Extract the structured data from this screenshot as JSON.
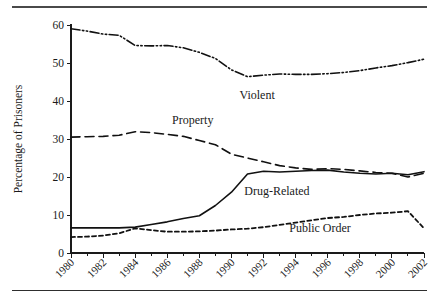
{
  "figure": {
    "top_rule": "horizontal-rule",
    "bottom_rule": "horizontal-rule"
  },
  "chart_data": {
    "type": "line",
    "title": "",
    "xlabel": "",
    "ylabel": "Percentage of Prisoners",
    "xlim": [
      1980,
      2002
    ],
    "ylim": [
      0,
      60
    ],
    "yticks": [
      0,
      10,
      20,
      30,
      40,
      50,
      60
    ],
    "xticks": [
      1980,
      1982,
      1984,
      1986,
      1988,
      1990,
      1992,
      1994,
      1996,
      1998,
      2000,
      2002
    ],
    "minor_xticks": [
      1981,
      1983,
      1985,
      1987,
      1989,
      1991,
      1993,
      1995,
      1997,
      1999,
      2001
    ],
    "grid": false,
    "legend": "inline-labels",
    "x": [
      1980,
      1981,
      1982,
      1983,
      1984,
      1985,
      1986,
      1987,
      1988,
      1989,
      1990,
      1991,
      1992,
      1993,
      1994,
      1995,
      1996,
      1997,
      1998,
      1999,
      2000,
      2001,
      2002
    ],
    "series": [
      {
        "name": "Violent",
        "label": "Violent",
        "style": "dash-dot-dot",
        "values": [
          59.0,
          58.4,
          57.6,
          57.3,
          54.6,
          54.5,
          54.6,
          54.0,
          52.8,
          51.2,
          48.2,
          46.4,
          46.8,
          47.1,
          47.0,
          47.0,
          47.2,
          47.5,
          48.0,
          48.7,
          49.3,
          50.1,
          51.0
        ]
      },
      {
        "name": "Property",
        "label": "Property",
        "style": "dashed",
        "values": [
          30.5,
          30.6,
          30.7,
          31.0,
          31.9,
          31.7,
          31.2,
          30.7,
          29.6,
          28.5,
          26.0,
          25.0,
          24.0,
          23.0,
          22.4,
          22.0,
          22.2,
          22.0,
          21.6,
          21.2,
          21.0,
          20.0,
          21.0
        ]
      },
      {
        "name": "Drug-Related",
        "label": "Drug-Related",
        "style": "solid",
        "values": [
          6.6,
          6.6,
          6.6,
          6.6,
          6.8,
          7.5,
          8.2,
          9.1,
          9.8,
          12.5,
          16.0,
          20.8,
          21.5,
          21.3,
          21.5,
          21.7,
          21.8,
          21.3,
          21.0,
          20.8,
          21.0,
          20.6,
          21.4
        ]
      },
      {
        "name": "Public Order",
        "label": "Public Order",
        "style": "short-dashed",
        "values": [
          4.2,
          4.3,
          4.6,
          5.2,
          6.5,
          6.0,
          5.6,
          5.6,
          5.7,
          5.9,
          6.2,
          6.4,
          6.8,
          7.4,
          8.0,
          8.6,
          9.2,
          9.5,
          10.0,
          10.4,
          10.6,
          11.0,
          6.5
        ]
      }
    ],
    "annotations": [
      {
        "text": "Violent",
        "x": 1990.5,
        "y": 40.5
      },
      {
        "text": "Property",
        "x": 1986.3,
        "y": 34.0
      },
      {
        "text": "Drug-Related",
        "x": 1990.8,
        "y": 15.2
      },
      {
        "text": "Public Order",
        "x": 1993.6,
        "y": 5.6
      }
    ]
  }
}
